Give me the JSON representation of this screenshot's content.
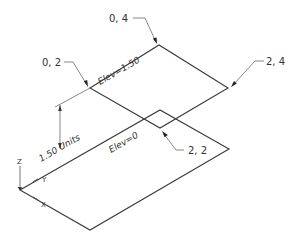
{
  "diagram": {
    "type": "isometric-elevation-planes",
    "colors": {
      "line": "#3a3a3a",
      "leader": "#555555",
      "text": "#333333",
      "background": "#ffffff"
    },
    "planes": [
      {
        "name": "upper-plane",
        "elevation_label": "Elev=1.50"
      },
      {
        "name": "lower-plane",
        "elevation_label": "Elev=0"
      }
    ],
    "point_labels": [
      {
        "id": "p04",
        "text": "0, 4"
      },
      {
        "id": "p02",
        "text": "0, 2"
      },
      {
        "id": "p24",
        "text": "2, 4"
      },
      {
        "id": "p22",
        "text": "2, 2"
      }
    ],
    "dimension": {
      "text": "1.50 Units"
    },
    "ucs_icon": {
      "z_label": "Z",
      "y_label": "Y",
      "x_label": "X"
    }
  }
}
